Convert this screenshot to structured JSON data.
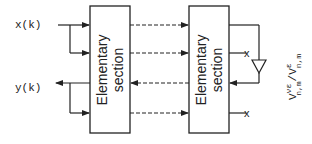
{
  "diagram": {
    "inputs": {
      "x_label": "x(k)",
      "y_label": "y(k)"
    },
    "sections": [
      {
        "line1": "Elementary",
        "line2": "section"
      },
      {
        "line1": "Elementary",
        "line2": "section"
      }
    ],
    "terminal_mark": "x",
    "ratio_label": {
      "numerator_base": "V",
      "numerator_sup": "νε",
      "numerator_sub": "n,m",
      "slash": "/",
      "denominator_base": "V",
      "denominator_sup": "ε",
      "denominator_sub": "n,m"
    },
    "colors": {
      "stroke": "#222222",
      "background": "#ffffff"
    }
  }
}
